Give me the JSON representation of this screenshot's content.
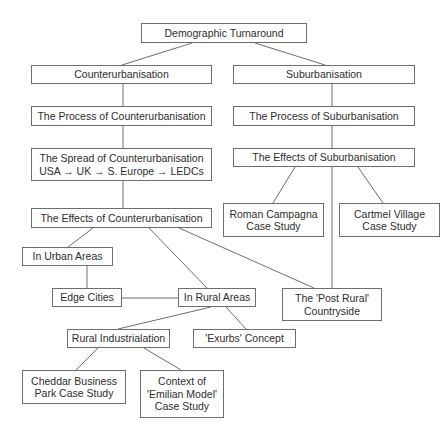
{
  "diagram": {
    "title_fragment": "…",
    "line_color": "#6e6e6e",
    "nodes": [
      {
        "id": "demographic-turnaround",
        "label": "Demographic Turnaround",
        "box": [
          141,
          23,
          166,
          20
        ]
      },
      {
        "id": "counterurbanisation",
        "label": "Counterurbanisation",
        "box": [
          31,
          65,
          181,
          19
        ]
      },
      {
        "id": "suburbanisation",
        "label": "Suburbanisation",
        "box": [
          233,
          65,
          182,
          19
        ]
      },
      {
        "id": "process-counterurbanisation",
        "label": "The Process of Counterurbanisation",
        "box": [
          31,
          106,
          181,
          20
        ]
      },
      {
        "id": "process-suburbanisation",
        "label": "The Process of Suburbanisation",
        "box": [
          233,
          106,
          182,
          20
        ]
      },
      {
        "id": "spread-counterurbanisation",
        "label": "The Spread of Counterurbanisation\nUSA → UK → S. Europe → LEDCs",
        "box": [
          31,
          148,
          181,
          33
        ]
      },
      {
        "id": "effects-suburbanisation",
        "label": "The Effects of Suburbanisation",
        "box": [
          233,
          148,
          182,
          19
        ]
      },
      {
        "id": "effects-counterurbanisation",
        "label": "The Effects of Counterurbanisation",
        "box": [
          31,
          208,
          181,
          20
        ]
      },
      {
        "id": "roman-campagna",
        "label": "Roman Campagna\nCase Study",
        "box": [
          223,
          203,
          101,
          34
        ]
      },
      {
        "id": "cartmel-village",
        "label": "Cartmel Village\nCase Study",
        "box": [
          339,
          203,
          101,
          34
        ]
      },
      {
        "id": "in-urban-areas",
        "label": "In Urban Areas",
        "box": [
          22,
          247,
          91,
          19
        ]
      },
      {
        "id": "edge-cities",
        "label": "Edge Cities",
        "box": [
          52,
          288,
          70,
          19
        ]
      },
      {
        "id": "in-rural-areas",
        "label": "In Rural Areas",
        "box": [
          178,
          288,
          78,
          19
        ]
      },
      {
        "id": "post-rural-countryside",
        "label": "The 'Post Rural'\nCountryside",
        "box": [
          282,
          288,
          100,
          33
        ]
      },
      {
        "id": "rural-industrialation",
        "label": "Rural Industrialation",
        "box": [
          67,
          329,
          103,
          19
        ]
      },
      {
        "id": "exurbs-concept",
        "label": "'Exurbs' Concept",
        "box": [
          193,
          329,
          103,
          19
        ]
      },
      {
        "id": "cheddar-business-park",
        "label": "Cheddar Business\nPark Case Study",
        "box": [
          22,
          370,
          104,
          34
        ]
      },
      {
        "id": "emilian-model",
        "label": "Context of\n'Emilian Model'\nCase Study",
        "box": [
          140,
          370,
          84,
          48
        ]
      }
    ],
    "edges": [
      {
        "from": "demographic-turnaround",
        "to": "counterurbanisation",
        "points": [
          [
            192,
            43
          ],
          [
            122,
            65
          ]
        ]
      },
      {
        "from": "demographic-turnaround",
        "to": "suburbanisation",
        "points": [
          [
            255,
            43
          ],
          [
            325,
            65
          ]
        ]
      },
      {
        "from": "counterurbanisation",
        "to": "process-counterurbanisation",
        "points": [
          [
            123,
            84
          ],
          [
            123,
            106
          ]
        ]
      },
      {
        "from": "process-counterurbanisation",
        "to": "spread-counterurbanisation",
        "points": [
          [
            123,
            126
          ],
          [
            123,
            148
          ]
        ]
      },
      {
        "from": "spread-counterurbanisation",
        "to": "effects-counterurbanisation",
        "points": [
          [
            123,
            181
          ],
          [
            123,
            208
          ]
        ]
      },
      {
        "from": "suburbanisation",
        "to": "process-suburbanisation",
        "points": [
          [
            332,
            84
          ],
          [
            332,
            106
          ]
        ]
      },
      {
        "from": "process-suburbanisation",
        "to": "effects-suburbanisation",
        "points": [
          [
            332,
            126
          ],
          [
            332,
            148
          ]
        ]
      },
      {
        "from": "effects-suburbanisation",
        "to": "roman-campagna",
        "points": [
          [
            295,
            167
          ],
          [
            273,
            203
          ]
        ]
      },
      {
        "from": "effects-suburbanisation",
        "to": "cartmel-village",
        "points": [
          [
            358,
            167
          ],
          [
            383,
            203
          ]
        ]
      },
      {
        "from": "effects-suburbanisation",
        "to": "post-rural-countryside",
        "points": [
          [
            332,
            167
          ],
          [
            332,
            288
          ]
        ]
      },
      {
        "from": "effects-counterurbanisation",
        "to": "in-urban-areas",
        "points": [
          [
            93,
            228
          ],
          [
            68,
            247
          ]
        ]
      },
      {
        "from": "effects-counterurbanisation",
        "to": "in-rural-areas",
        "points": [
          [
            149,
            228
          ],
          [
            207,
            288
          ]
        ]
      },
      {
        "from": "effects-counterurbanisation",
        "to": "post-rural-countryside",
        "points": [
          [
            179,
            228
          ],
          [
            314,
            288
          ]
        ]
      },
      {
        "from": "in-urban-areas",
        "to": "edge-cities",
        "points": [
          [
            87,
            266
          ],
          [
            87,
            288
          ]
        ]
      },
      {
        "from": "edge-cities",
        "to": "in-rural-areas",
        "points": [
          [
            122,
            298
          ],
          [
            178,
            298
          ]
        ]
      },
      {
        "from": "in-rural-areas",
        "to": "rural-industrialation",
        "points": [
          [
            211,
            307
          ],
          [
            118,
            329
          ]
        ]
      },
      {
        "from": "in-rural-areas",
        "to": "exurbs-concept",
        "points": [
          [
            226,
            307
          ],
          [
            246,
            329
          ]
        ]
      },
      {
        "from": "rural-industrialation",
        "to": "cheddar-business-park",
        "points": [
          [
            98,
            348
          ],
          [
            76,
            370
          ]
        ]
      },
      {
        "from": "rural-industrialation",
        "to": "emilian-model",
        "points": [
          [
            144,
            348
          ],
          [
            181,
            370
          ]
        ]
      }
    ]
  }
}
